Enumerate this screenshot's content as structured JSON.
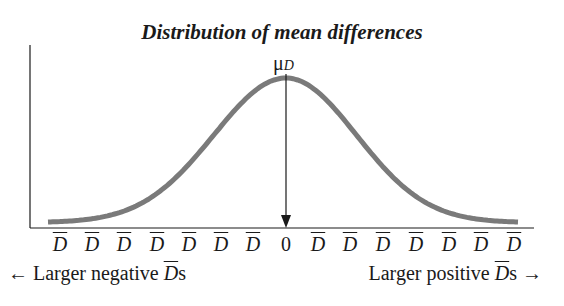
{
  "title": "Distribution of mean differences",
  "mean_label": {
    "symbol": "μ",
    "subscript": "D"
  },
  "colors": {
    "curve": "#7a7a7a",
    "axis": "#1a1a1a",
    "background": "#ffffff"
  },
  "x_ticks": [
    "D",
    "D",
    "D",
    "D",
    "D",
    "D",
    "D",
    "0",
    "D",
    "D",
    "D",
    "D",
    "D",
    "D",
    "D"
  ],
  "direction_labels": {
    "left_arrow": "←",
    "left_text": "Larger negative ",
    "left_var": "D",
    "left_suffix": "s",
    "right_text": "Larger positive ",
    "right_var": "D",
    "right_suffix": "s",
    "right_arrow": "→"
  },
  "chart_data": {
    "type": "line",
    "title": "Distribution of mean differences",
    "distribution": "normal",
    "mean": 0,
    "x_tick_labels": [
      "D̄",
      "D̄",
      "D̄",
      "D̄",
      "D̄",
      "D̄",
      "D̄",
      "0",
      "D̄",
      "D̄",
      "D̄",
      "D̄",
      "D̄",
      "D̄",
      "D̄"
    ],
    "x_range_sd": [
      -3.3,
      3.3
    ],
    "annotations": [
      {
        "text": "μD",
        "x": 0,
        "type": "arrow-down-to-axis"
      },
      {
        "text": "← Larger negative D̄s",
        "position": "bottom-left"
      },
      {
        "text": "Larger positive D̄s →",
        "position": "bottom-right"
      }
    ],
    "xlabel": "",
    "ylabel": "",
    "grid": false
  }
}
